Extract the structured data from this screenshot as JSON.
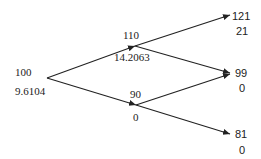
{
  "diagram": {
    "type": "binomial-tree",
    "steps": 2,
    "root": {
      "price": "100",
      "value": "9.6104"
    },
    "step1": {
      "up": {
        "price": "110",
        "value": "14.2063"
      },
      "down": {
        "price": "90",
        "value": "0"
      }
    },
    "step2": {
      "uu": {
        "price": "121",
        "value": "21"
      },
      "ud": {
        "price": "99",
        "value": "0"
      },
      "dd": {
        "price": "81",
        "value": "0"
      }
    },
    "colors": {
      "line": "#222222",
      "text": "#222222",
      "background": "#ffffff"
    }
  }
}
